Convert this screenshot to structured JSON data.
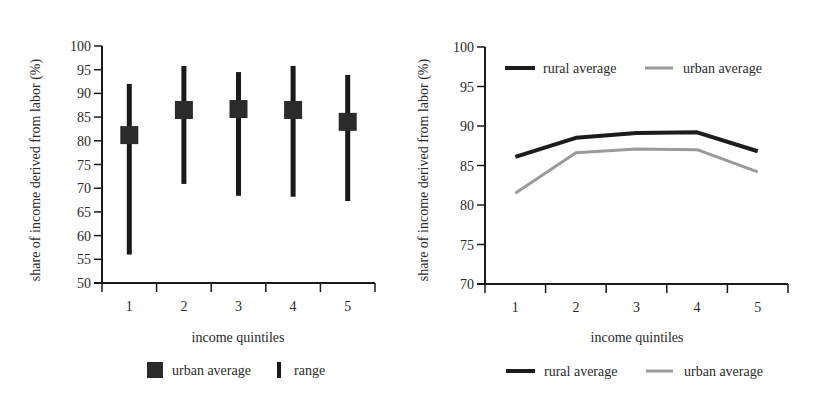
{
  "chart_data": [
    {
      "id": "left",
      "type": "range",
      "title": "",
      "xlabel": "income quintiles",
      "ylabel": "share of income derived from labor (%)",
      "categories": [
        "1",
        "2",
        "3",
        "4",
        "5"
      ],
      "ylim": [
        50,
        100
      ],
      "yticks": [
        50,
        55,
        60,
        65,
        70,
        75,
        80,
        85,
        90,
        95,
        100
      ],
      "grid": false,
      "series": [
        {
          "name": "urban average",
          "marker": "square",
          "color": "#2b2b2b",
          "values": [
            81.2,
            86.5,
            86.7,
            86.5,
            84.0
          ]
        },
        {
          "name": "range",
          "marker": "vertical-bar",
          "color": "#1a1a1a",
          "low": [
            56.0,
            70.9,
            68.4,
            68.2,
            67.3
          ],
          "high": [
            92.0,
            95.8,
            94.5,
            95.8,
            93.9
          ]
        }
      ],
      "legend": {
        "position": "bottom",
        "items": [
          {
            "label": "urban average",
            "symbol": "square"
          },
          {
            "label": "range",
            "symbol": "bar"
          }
        ]
      }
    },
    {
      "id": "right",
      "type": "line",
      "title": "",
      "xlabel": "income quintiles",
      "ylabel": "share of income derived from labor (%)",
      "categories": [
        "1",
        "2",
        "3",
        "4",
        "5"
      ],
      "ylim": [
        70,
        100
      ],
      "yticks": [
        70,
        75,
        80,
        85,
        90,
        95,
        100
      ],
      "grid": false,
      "series": [
        {
          "name": "rural average",
          "color": "#1c1c1c",
          "width": 4,
          "values": [
            86.1,
            88.5,
            89.1,
            89.2,
            86.8
          ]
        },
        {
          "name": "urban average",
          "color": "#9a9a9a",
          "width": 3,
          "values": [
            81.5,
            86.6,
            87.1,
            87.0,
            84.2
          ]
        }
      ],
      "legend": {
        "position": "top-inside and bottom",
        "items": [
          {
            "label": "rural average",
            "symbol": "line-dark"
          },
          {
            "label": "urban average",
            "symbol": "line-gray"
          }
        ]
      }
    }
  ]
}
